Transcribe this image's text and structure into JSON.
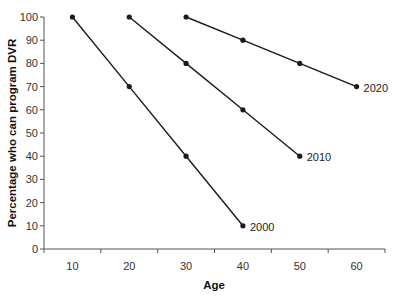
{
  "chart_data": {
    "type": "line",
    "title": "",
    "xlabel": "Age",
    "ylabel": "Percentage who can program DVR",
    "x_categories": [
      10,
      20,
      30,
      40,
      50,
      60
    ],
    "yticks": [
      0,
      10,
      20,
      30,
      40,
      50,
      60,
      70,
      80,
      90,
      100
    ],
    "ylim": [
      0,
      100
    ],
    "grid": false,
    "legend": "inline labels at line ends",
    "series": [
      {
        "name": "2000",
        "x": [
          10,
          20,
          30,
          40
        ],
        "values": [
          100,
          70,
          40,
          10
        ]
      },
      {
        "name": "2010",
        "x": [
          20,
          30,
          40,
          50
        ],
        "values": [
          100,
          80,
          60,
          40
        ]
      },
      {
        "name": "2020",
        "x": [
          30,
          40,
          50,
          60
        ],
        "values": [
          100,
          90,
          80,
          70
        ]
      }
    ],
    "line_color": "#1a1a1a",
    "marker": "circle"
  }
}
